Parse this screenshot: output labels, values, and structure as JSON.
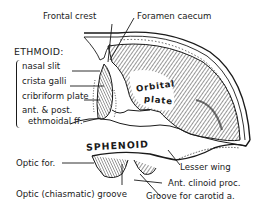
{
  "diagram": {
    "colors": {
      "ink": "#1a1a1a",
      "background": "#ffffff"
    },
    "labels": {
      "frontal_crest": "Frontal crest",
      "foramen_caecum": "Foramen caecum",
      "ethmoid_heading": "ETHMOID:",
      "nasal_slit": "nasal slit",
      "crista_galli": "crista galli",
      "cribriform_plate": "cribriform plate",
      "ethmoidal_ff_1": "ant. & post.",
      "ethmoidal_ff_2": "ethmoidal ff.",
      "orbital_1": "Orbital",
      "orbital_2": "plate",
      "sphenoid": "SPHENOID",
      "optic_foramen": "Optic for.",
      "optic_groove": "Optic (chiasmatic) groove",
      "lesser_wing": "Lesser wing",
      "ant_clinoid": "Ant. clinoid proc.",
      "carotid_groove": "Groove for carotid a."
    }
  }
}
